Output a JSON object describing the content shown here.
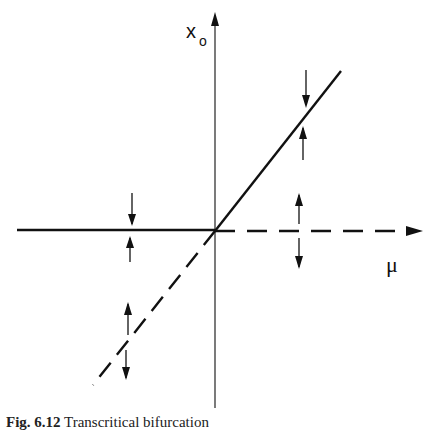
{
  "figure": {
    "axis_labels": {
      "y": "x",
      "y_subscript": "o",
      "x": "μ"
    },
    "caption": {
      "label": "Fig. 6.12",
      "text": "Transcritical bifurcation"
    },
    "branches": [
      {
        "name": "x0 = 0 for μ < 0",
        "style": "solid",
        "stability": "stable"
      },
      {
        "name": "x0 = 0 for μ > 0",
        "style": "dashed",
        "stability": "unstable"
      },
      {
        "name": "x0 = μ for μ > 0",
        "style": "solid",
        "stability": "stable"
      },
      {
        "name": "x0 = μ for μ < 0",
        "style": "dashed",
        "stability": "unstable"
      }
    ],
    "colors": {
      "ink": "#111111",
      "background": "#ffffff"
    }
  }
}
